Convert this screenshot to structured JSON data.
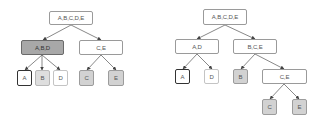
{
  "diagram": {
    "type": "hierarchical-clustering-trees",
    "colors": {
      "edge": "#444444",
      "default_fill": "#ffffff",
      "highlight_fill": "#a8a8a8",
      "leaf_gray_fill": "#d2d2d2",
      "leaf_light_fill": "#dedede"
    },
    "left_tree": {
      "root": {
        "label": "A,B,C,D,E"
      },
      "level1": [
        {
          "label": "A,B,D",
          "style": "dark"
        },
        {
          "label": "C,E",
          "style": "white"
        }
      ],
      "leaves": [
        {
          "label": "A",
          "parent": "A,B,D",
          "style": "bold"
        },
        {
          "label": "B",
          "parent": "A,B,D",
          "style": "light-gray"
        },
        {
          "label": "D",
          "parent": "A,B,D",
          "style": "light"
        },
        {
          "label": "C",
          "parent": "C,E",
          "style": "gray"
        },
        {
          "label": "E",
          "parent": "C,E",
          "style": "gray"
        }
      ]
    },
    "right_tree": {
      "root": {
        "label": "A,B,C,D,E"
      },
      "level1": [
        {
          "label": "A,D",
          "style": "white"
        },
        {
          "label": "B,C,E",
          "style": "white"
        }
      ],
      "level2": [
        {
          "label": "A",
          "parent": "A,D",
          "style": "bold"
        },
        {
          "label": "D",
          "parent": "A,D",
          "style": "light"
        },
        {
          "label": "B",
          "parent": "B,C,E",
          "style": "gray"
        },
        {
          "label": "C,E",
          "parent": "B,C,E",
          "style": "white"
        }
      ],
      "level3": [
        {
          "label": "C",
          "parent": "C,E",
          "style": "gray"
        },
        {
          "label": "E",
          "parent": "C,E",
          "style": "gray"
        }
      ]
    }
  }
}
